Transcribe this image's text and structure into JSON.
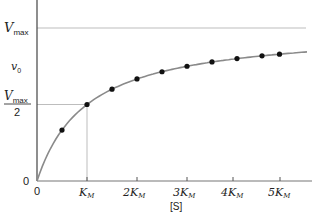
{
  "chart_data": {
    "type": "line",
    "title": "",
    "xlabel": "[S]",
    "ylabel": "v0",
    "x_ticks": [
      "0",
      "KM",
      "2KM",
      "3KM",
      "4KM",
      "5KM"
    ],
    "y_ticks": [
      "0",
      "Vmax/2",
      "Vmax"
    ],
    "xlim": [
      0,
      5.4
    ],
    "ylim": [
      0,
      1.18
    ],
    "grid": false,
    "reference_lines": [
      {
        "axis": "y",
        "value": 1.0,
        "label": "Vmax"
      },
      {
        "axis": "y",
        "value": 0.5,
        "label": "Vmax/2",
        "x_end": 1.0
      },
      {
        "axis": "x",
        "value": 1.0,
        "label": "KM",
        "y_end": 0.5
      }
    ],
    "series": [
      {
        "name": "Michaelis-Menten curve",
        "style": "line",
        "equation": "v0 = Vmax[S]/(KM+[S])",
        "x": [
          0,
          0.5,
          1,
          1.5,
          2,
          2.5,
          3,
          3.5,
          4,
          4.5,
          5,
          5.4
        ],
        "values": [
          0,
          0.333,
          0.5,
          0.6,
          0.667,
          0.714,
          0.75,
          0.778,
          0.8,
          0.818,
          0.833,
          0.844
        ]
      },
      {
        "name": "data points",
        "style": "scatter",
        "x": [
          0.5,
          1.0,
          1.5,
          2.0,
          2.5,
          3.0,
          3.5,
          4.0,
          4.5,
          4.85
        ],
        "values": [
          0.333,
          0.5,
          0.6,
          0.667,
          0.714,
          0.75,
          0.778,
          0.8,
          0.818,
          0.829
        ]
      }
    ]
  },
  "labels": {
    "vmax": "V",
    "vmax_sub": "max",
    "v0": "v",
    "v0_sub": "0",
    "half_num": "V",
    "half_num_sub": "max",
    "half_den": "2",
    "y_zero": "0",
    "x_zero": "0",
    "xaxis": "[S]",
    "km1": "K",
    "km2": "2K",
    "km3": "3K",
    "km4": "4K",
    "km5": "5K",
    "km_sub": "M"
  }
}
